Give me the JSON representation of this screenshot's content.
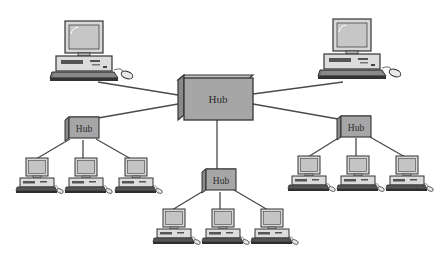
{
  "diagram": {
    "type": "network-topology",
    "topology": "hierarchical star (tree)",
    "colors": {
      "background": "#ffffff",
      "hub_front": "#a6a6a6",
      "hub_top": "#c4c4c4",
      "hub_side": "#8a8a8a",
      "outline": "#3a3a3a",
      "screen": "#c9c9c9",
      "cable": "#4a4a4a"
    },
    "central_hub": {
      "label": "Hub"
    },
    "top_computers": [
      {
        "id": "pc-top-left"
      },
      {
        "id": "pc-top-right"
      }
    ],
    "sub_hubs": [
      {
        "id": "hub-left",
        "label": "Hub",
        "computers": 3
      },
      {
        "id": "hub-bottom",
        "label": "Hub",
        "computers": 3
      },
      {
        "id": "hub-right",
        "label": "Hub",
        "computers": 3
      }
    ]
  }
}
